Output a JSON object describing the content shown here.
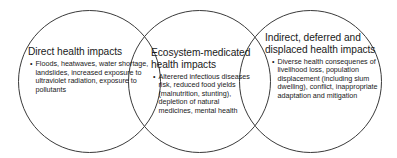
{
  "diagram": {
    "type": "venn",
    "background_color": "#ffffff",
    "stroke_color": "#3a3a3a",
    "circles": [
      {
        "id": "left",
        "heading": "Direct health impacts",
        "bullets": [
          "Floods, heatwaves, water shortage, landslides, increased exposure to ultraviolet radiation, exposure to pollutants"
        ]
      },
      {
        "id": "center",
        "heading": "Ecosystem-medicated health impacts",
        "bullets": [
          "Alterered infectious diseases risk, reduced food yields (malnutrition, stunting), depletion of natural medicines, mental health"
        ]
      },
      {
        "id": "right",
        "heading": "Indirect, deferred and displaced health impacts",
        "bullets": [
          "Diverse health consequenes of livelihood loss, population displacement (including slum dwelling), conflict, inappropriate adaptation and mitigation"
        ]
      }
    ]
  }
}
